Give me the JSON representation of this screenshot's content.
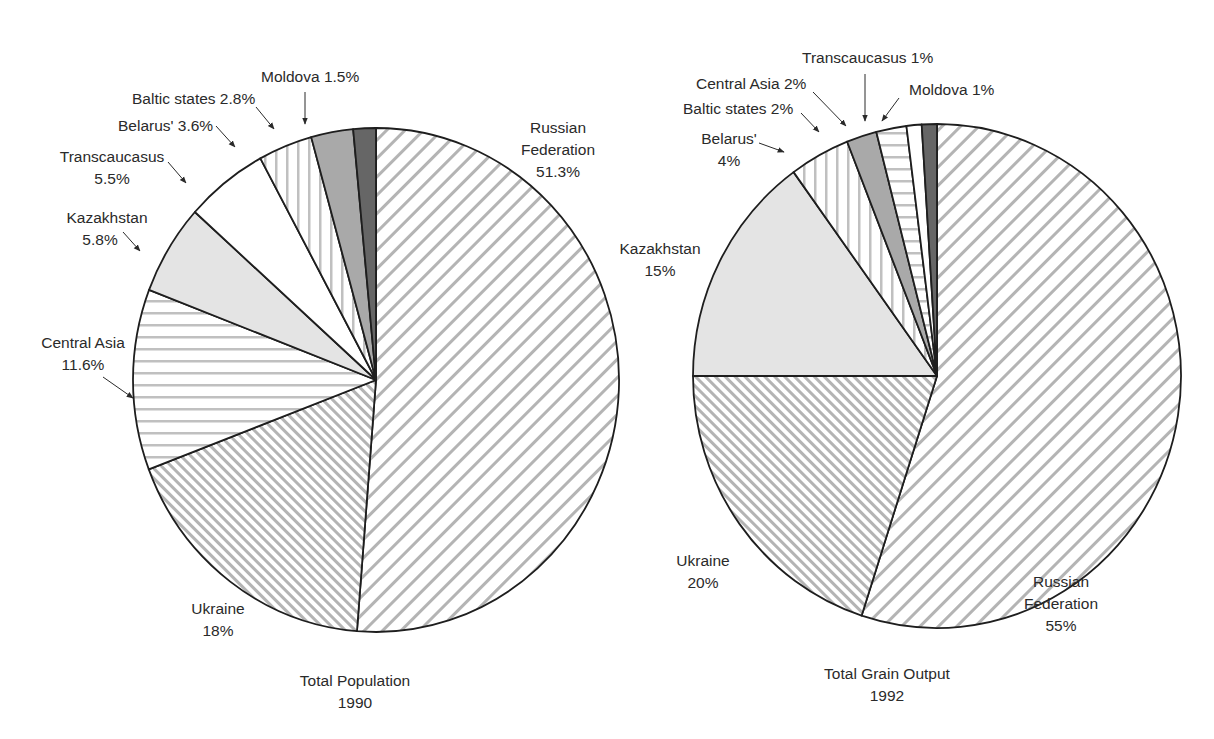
{
  "chart_data": [
    {
      "type": "pie",
      "title": "Total Population",
      "subtitle": "1990",
      "start_angle": "12 o'clock, clockwise",
      "categories": [
        "Russian Federation",
        "Ukraine",
        "Central Asia",
        "Kazakhstan",
        "Transcaucasus",
        "Belarus'",
        "Baltic states",
        "Moldova"
      ],
      "values": [
        51.3,
        18,
        11.6,
        5.8,
        5.5,
        3.6,
        2.8,
        1.5
      ],
      "labels": [
        "Russian Federation 51.3%",
        "Ukraine 18%",
        "Central Asia 11.6%",
        "Kazakhstan 5.8%",
        "Transcaucasus 5.5%",
        "Belarus' 3.6%",
        "Baltic states 2.8%",
        "Moldova 1.5%"
      ],
      "unit": "%"
    },
    {
      "type": "pie",
      "title": "Total Grain Output",
      "subtitle": "1992",
      "start_angle": "12 o'clock, clockwise",
      "categories": [
        "Russian Federation",
        "Ukraine",
        "Kazakhstan",
        "Belarus'",
        "Baltic states",
        "Central Asia",
        "Transcaucasus",
        "Moldova"
      ],
      "values": [
        55,
        20,
        15,
        4,
        2,
        2,
        1,
        1
      ],
      "labels": [
        "Russian Federation 55%",
        "Ukraine 20%",
        "Kazakhstan 15%",
        "Belarus' 4%",
        "Baltic states 2%",
        "Central Asia 2%",
        "Transcaucasus 1%",
        "Moldova 1%"
      ],
      "unit": "%"
    }
  ],
  "fills": {
    "Russian Federation": "pattern-back-diagonal",
    "Ukraine": "pattern-dense-forward-diagonal",
    "Central Asia": "pattern-horizontal",
    "Kazakhstan": "#e4e4e4",
    "Transcaucasus": "#ffffff",
    "Belarus'": "pattern-vertical",
    "Baltic states": "#a9a9a9",
    "Moldova": "#666666"
  },
  "pie1": {
    "caption_line1": "Total Population",
    "caption_line2": "1990",
    "labels": {
      "russia_1": "Russian",
      "russia_2": "Federation",
      "russia_3": "51.3%",
      "ukraine_1": "Ukraine",
      "ukraine_2": "18%",
      "central_asia_1": "Central Asia",
      "central_asia_2": "11.6%",
      "kazakhstan_1": "Kazakhstan",
      "kazakhstan_2": "5.8%",
      "transcaucasus_1": "Transcaucasus",
      "transcaucasus_2": "5.5%",
      "belarus": "Belarus' 3.6%",
      "baltic": "Baltic states 2.8%",
      "moldova": "Moldova 1.5%"
    }
  },
  "pie2": {
    "caption_line1": "Total Grain Output",
    "caption_line2": "1992",
    "labels": {
      "russia_1": "Russian",
      "russia_2": "Federation",
      "russia_3": "55%",
      "ukraine_1": "Ukraine",
      "ukraine_2": "20%",
      "kazakhstan_1": "Kazakhstan",
      "kazakhstan_2": "15%",
      "belarus_1": "Belarus'",
      "belarus_2": "4%",
      "baltic": "Baltic states 2%",
      "central_asia": "Central Asia 2%",
      "transcaucasus": "Transcaucasus 1%",
      "moldova": "Moldova 1%"
    }
  }
}
